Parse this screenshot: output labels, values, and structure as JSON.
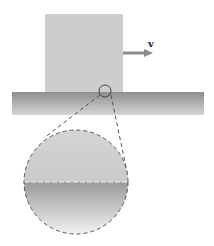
{
  "diagram": {
    "velocity_label": "v",
    "colors": {
      "block": "#cdcdcd",
      "floor_top": "#8a8a8a",
      "floor_bottom": "#d8d8d8",
      "arrow": "#8c8c8c",
      "dash": "#555555"
    }
  }
}
